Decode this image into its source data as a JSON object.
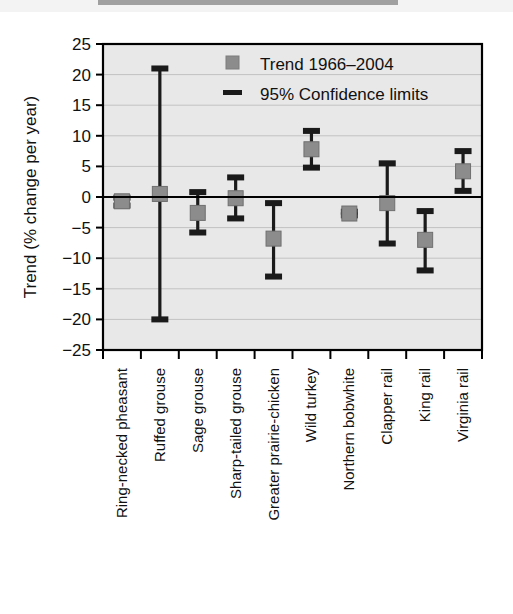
{
  "chart_data": {
    "type": "scatter",
    "title": "",
    "xlabel": "",
    "ylabel": "Trend (% change per year)",
    "ylim": [
      -25,
      25
    ],
    "ytick_labels": [
      "25",
      "20",
      "15",
      "10",
      "5",
      "0",
      "−5",
      "−10",
      "−15",
      "−20",
      "−25"
    ],
    "yticks": [
      25,
      20,
      15,
      10,
      5,
      0,
      -5,
      -10,
      -15,
      -20,
      -25
    ],
    "grid": true,
    "legend_position": "top-center",
    "legend": [
      {
        "label": "Trend 1966–2004",
        "marker": "square",
        "color": "#8c8c8c"
      },
      {
        "label": "95% Confidence limits",
        "marker": "bar",
        "color": "#1a1a1a"
      }
    ],
    "categories": [
      "Ring-necked pheasant",
      "Ruffed grouse",
      "Sage grouse",
      "Sharp-tailed grouse",
      "Greater prairie-chicken",
      "Wild turkey",
      "Northern bobwhite",
      "Clapper rail",
      "King rail",
      "Virginia rail"
    ],
    "series": [
      {
        "name": "Trend 1966–2004",
        "values": [
          -0.7,
          0.5,
          -2.6,
          -0.2,
          -6.8,
          7.8,
          -2.7,
          -1.0,
          -7.0,
          4.2
        ]
      },
      {
        "name": "95% Confidence limits upper",
        "values": [
          -0.1,
          21.0,
          0.8,
          3.2,
          -1.0,
          10.8,
          -2.4,
          5.5,
          -2.3,
          7.5
        ]
      },
      {
        "name": "95% Confidence limits lower",
        "values": [
          -1.4,
          -20.0,
          -5.8,
          -3.5,
          -13.0,
          4.8,
          -3.0,
          -7.6,
          -12.0,
          1.0
        ]
      }
    ],
    "reference_line": 0,
    "colors": {
      "plot_background": "#e8e8e8",
      "marker": "#8c8c8c",
      "error_bar": "#1a1a1a",
      "axis": "#000000",
      "gridline": "#c2c2c2"
    }
  }
}
